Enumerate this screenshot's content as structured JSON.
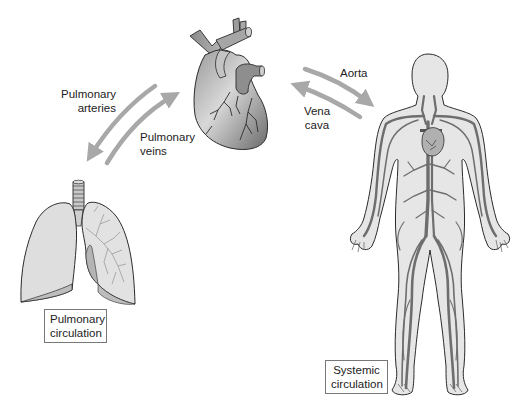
{
  "diagram": {
    "colors": {
      "background": "#ffffff",
      "arrow": "#a8a8a8",
      "organ_fill_light": "#e2e2e2",
      "organ_fill_mid": "#b4b4b4",
      "organ_fill_dark": "#7c7c7c",
      "vessel": "#6e6e6e",
      "outline": "#2b2b2b",
      "text": "#222222",
      "box_border": "#777777"
    },
    "labels": {
      "pulmonary_arteries": [
        "Pulmonary",
        "arteries"
      ],
      "pulmonary_veins": [
        "Pulmonary",
        "veins"
      ],
      "aorta": "Aorta",
      "vena_cava": [
        "Vena",
        "cava"
      ]
    },
    "boxes": {
      "pulmonary_circulation": [
        "Pulmonary",
        "circulation"
      ],
      "systemic_circulation": [
        "Systemic",
        "circulation"
      ]
    },
    "figures": [
      {
        "name": "heart",
        "role": "central pump"
      },
      {
        "name": "lungs",
        "role": "pulmonary circuit"
      },
      {
        "name": "human-body",
        "role": "systemic circuit"
      }
    ],
    "arrows": [
      {
        "name": "pulmonary-arteries-arrow",
        "from": "heart",
        "to": "lungs"
      },
      {
        "name": "pulmonary-veins-arrow",
        "from": "lungs",
        "to": "heart"
      },
      {
        "name": "aorta-arrow",
        "from": "heart",
        "to": "body"
      },
      {
        "name": "vena-cava-arrow",
        "from": "body",
        "to": "heart"
      }
    ]
  }
}
